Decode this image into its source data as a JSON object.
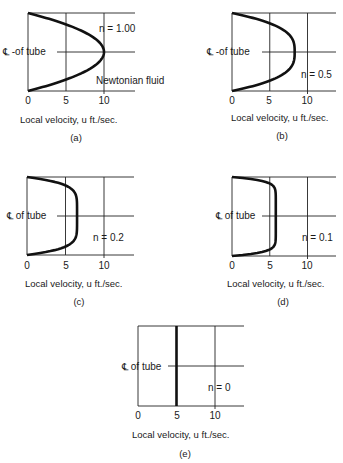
{
  "chart_data": [
    {
      "id": "a",
      "type": "line",
      "caption": "(a)",
      "xlabel": "Local velocity, u ft./sec.",
      "ylabel": "℄ -of tube",
      "xticks": [
        "0",
        "5",
        "10"
      ],
      "annotation": "n = 1.00",
      "annotation2": "Newtonian fluid",
      "n": 1.0,
      "umax": 10,
      "xlim": [
        0,
        14
      ],
      "ylim": [
        -1,
        1
      ],
      "grid": true
    },
    {
      "id": "b",
      "type": "line",
      "caption": "(b)",
      "xlabel": "Local velocity, u ft./sec.",
      "ylabel": "℄ -of tube",
      "xticks": [
        "0",
        "5",
        "10"
      ],
      "annotation": "n = 0.5",
      "n": 0.5,
      "umax": 8.3,
      "xlim": [
        0,
        14
      ],
      "ylim": [
        -1,
        1
      ],
      "grid": true
    },
    {
      "id": "c",
      "type": "line",
      "caption": "(c)",
      "xlabel": "Local velocity, u ft./sec.",
      "ylabel": "℄ of tube",
      "xticks": [
        "0",
        "5",
        "10"
      ],
      "annotation": "n = 0.2",
      "n": 0.2,
      "umax": 6.5,
      "xlim": [
        0,
        14
      ],
      "ylim": [
        -1,
        1
      ],
      "grid": true
    },
    {
      "id": "d",
      "type": "line",
      "caption": "(d)",
      "xlabel": "Local velocity, u ft./sec.",
      "ylabel": "℄ of tube",
      "xticks": [
        "0",
        "5",
        "10"
      ],
      "annotation": "n = 0.1",
      "n": 0.1,
      "umax": 5.8,
      "xlim": [
        0,
        14
      ],
      "ylim": [
        -1,
        1
      ],
      "grid": true
    },
    {
      "id": "e",
      "type": "line",
      "caption": "(e)",
      "xlabel": "Local velocity, u ft./sec.",
      "ylabel": "℄ of tube",
      "xticks": [
        "0",
        "5",
        "10"
      ],
      "annotation": "n = 0",
      "n": 0,
      "umax": 5,
      "xlim": [
        0,
        14
      ],
      "ylim": [
        -1,
        1
      ],
      "grid": true
    }
  ],
  "panels": {
    "a": {
      "caption": "(a)",
      "xlabel": "Local velocity, u ft./sec.",
      "ylabel": "℄ -of tube",
      "annotation": "n = 1.00",
      "annotation2": "Newtonian fluid",
      "t0": "0",
      "t5": "5",
      "t10": "10"
    },
    "b": {
      "caption": "(b)",
      "xlabel": "Local velocity, u ft./sec.",
      "ylabel": "℄ -of tube",
      "annotation": "n = 0.5",
      "t0": "0",
      "t5": "5",
      "t10": "10"
    },
    "c": {
      "caption": "(c)",
      "xlabel": "Local velocity, u ft./sec.",
      "ylabel": "℄ of tube",
      "annotation": "n = 0.2",
      "t0": "0",
      "t5": "5",
      "t10": "10"
    },
    "d": {
      "caption": "(d)",
      "xlabel": "Local velocity, u ft./sec.",
      "ylabel": "℄ of tube",
      "annotation": "n = 0.1",
      "t0": "0",
      "t5": "5",
      "t10": "10"
    },
    "e": {
      "caption": "(e)",
      "xlabel": "Local velocity, u ft./sec.",
      "ylabel": "℄ of tube",
      "annotation": "n = 0",
      "t0": "0",
      "t5": "5",
      "t10": "10"
    }
  }
}
